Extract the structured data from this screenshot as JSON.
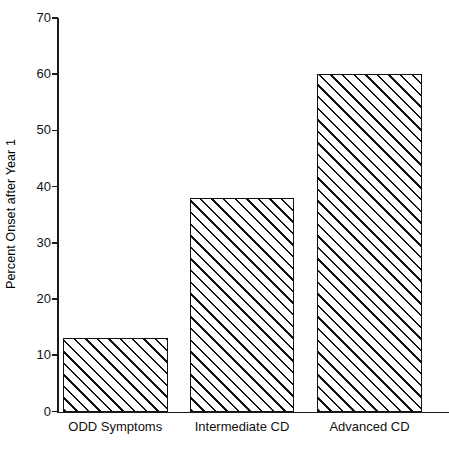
{
  "chart_data": {
    "type": "bar",
    "title": "",
    "subtitle": "",
    "xlabel": "",
    "ylabel": "Percent Onset after Year 1",
    "categories": [
      "ODD Symptoms",
      "Intermediate CD",
      "Advanced CD"
    ],
    "values": [
      13,
      38,
      60
    ],
    "ylim": [
      0,
      70
    ],
    "yticks": [
      0,
      10,
      20,
      30,
      40,
      50,
      60,
      70
    ],
    "ytick_labels": [
      "0",
      "10",
      "20",
      "30",
      "40",
      "50",
      "60",
      "70"
    ],
    "grid": false,
    "legend": null,
    "series": [
      {
        "name": "Percent Onset after Year 1",
        "values": [
          13,
          38,
          60
        ],
        "fill": "diagonal-hatch",
        "fill_color": "#ffffff",
        "edge_color": "#111111"
      }
    ],
    "annotations": []
  },
  "axes": {
    "y_axis_color": "#1a1a1a",
    "x_axis_color": "#1a1a1a"
  }
}
